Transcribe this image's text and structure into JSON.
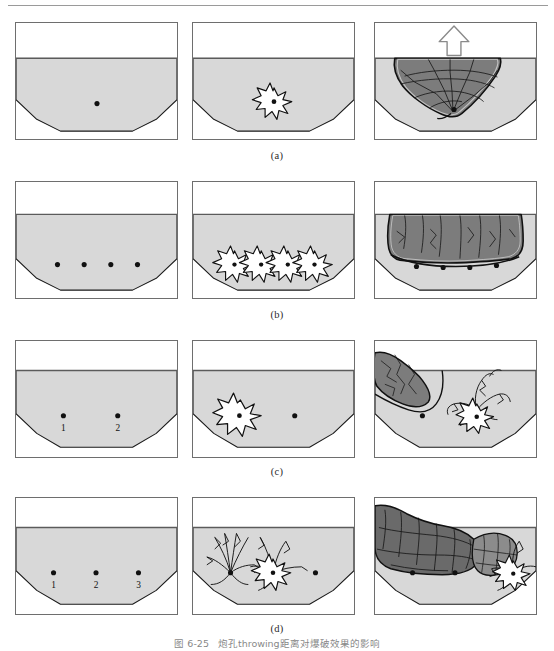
{
  "figure": {
    "caption_number": "图 6-25",
    "caption_text": "炮孔throwing距离对爆破效果的影响",
    "caption_full": "图 6-25   炮孔孔距对爆破效果的影响"
  },
  "colors": {
    "frame_border": "#6e6e6e",
    "rock_fill": "#d8d8d8",
    "rock_outline": "#1a1a1a",
    "broken_fill": "#7c7c7c",
    "broken_fill_dark": "#6a6a6a",
    "broken_fill_light": "#9a9a9a",
    "charge_dot": "#111111",
    "star_fill": "#ffffff",
    "arrow_fill": "#ffffff",
    "page_rule": "#9a9a9a"
  },
  "rows": [
    {
      "id": "row-a",
      "sublabel": "(a)",
      "description": "single deep charge",
      "charges": [
        {
          "label": "",
          "x": 82,
          "y": 82
        }
      ],
      "panels": [
        {
          "name": "charge-placement",
          "stage": "1",
          "shows_star": false,
          "shows_break": false,
          "shows_arrow": false
        },
        {
          "name": "detonation",
          "stage": "2",
          "shows_star": true,
          "shows_break": false,
          "shows_arrow": false
        },
        {
          "name": "fragmentation",
          "stage": "3",
          "shows_star": false,
          "shows_break": true,
          "shows_arrow": true
        }
      ]
    },
    {
      "id": "row-b",
      "sublabel": "(b)",
      "description": "four closely spaced charges",
      "charges": [
        {
          "label": "",
          "x": 42,
          "y": 84
        },
        {
          "label": "",
          "x": 68,
          "y": 84
        },
        {
          "label": "",
          "x": 95,
          "y": 84
        },
        {
          "label": "",
          "x": 122,
          "y": 84
        }
      ],
      "panels": [
        {
          "name": "charge-placement",
          "stage": "1",
          "shows_star": false,
          "shows_break": false,
          "shows_arrow": false
        },
        {
          "name": "detonation",
          "stage": "2",
          "shows_star": true,
          "shows_break": false,
          "shows_arrow": false
        },
        {
          "name": "fragmentation",
          "stage": "3",
          "shows_star": false,
          "shows_break": true,
          "shows_arrow": false
        }
      ]
    },
    {
      "id": "row-c",
      "sublabel": "(c)",
      "description": "two widely spaced charges",
      "charges": [
        {
          "label": "1",
          "x": 48,
          "y": 80
        },
        {
          "label": "2",
          "x": 103,
          "y": 80
        }
      ],
      "panels": [
        {
          "name": "charge-placement",
          "stage": "1",
          "shows_star": false,
          "shows_break": false,
          "shows_arrow": false
        },
        {
          "name": "detonation",
          "stage": "2",
          "shows_star": true,
          "shows_break": false,
          "shows_arrow": false
        },
        {
          "name": "fragmentation",
          "stage": "3",
          "shows_star": true,
          "shows_break": true,
          "shows_arrow": false
        }
      ]
    },
    {
      "id": "row-d",
      "sublabel": "(d)",
      "description": "three charges, sequential initiation",
      "charges": [
        {
          "label": "1",
          "x": 44,
          "y": 80
        },
        {
          "label": "2",
          "x": 83,
          "y": 80
        },
        {
          "label": "3",
          "x": 122,
          "y": 80
        }
      ],
      "panels": [
        {
          "name": "charge-placement",
          "stage": "1",
          "shows_star": false,
          "shows_break": false,
          "shows_arrow": false
        },
        {
          "name": "detonation",
          "stage": "2",
          "shows_star": true,
          "shows_break": false,
          "shows_arrow": false
        },
        {
          "name": "fragmentation",
          "stage": "3",
          "shows_star": true,
          "shows_break": true,
          "shows_arrow": false
        }
      ]
    }
  ]
}
